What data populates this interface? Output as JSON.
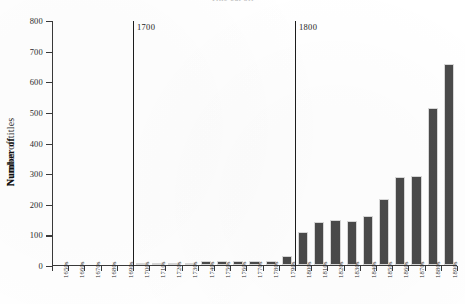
{
  "chart_data": {
    "type": "bar",
    "title": "Title cut off",
    "xlabel": "",
    "ylabel": "Number of titles",
    "ylabel_overlap": "Number of",
    "ylim": [
      0,
      800
    ],
    "yticks": [
      0,
      100,
      200,
      300,
      400,
      500,
      600,
      700,
      800
    ],
    "grid": false,
    "legend": false,
    "categories": [
      "1650s",
      "1660s",
      "1670s",
      "1680s",
      "1690s",
      "1700s",
      "1710s",
      "1720s",
      "1730s",
      "1740s",
      "1750s",
      "1760s",
      "1770s",
      "1780s",
      "1790s",
      "1800s",
      "1810s",
      "1820s",
      "1830s",
      "1840s",
      "1850s",
      "1860s",
      "1870s",
      "1880s",
      "1890s"
    ],
    "values": [
      0,
      0,
      0,
      0,
      0,
      2,
      3,
      6,
      6,
      11,
      12,
      13,
      13,
      14,
      30,
      108,
      141,
      146,
      145,
      160,
      215,
      288,
      290,
      516,
      660
    ],
    "annotations": [
      {
        "label": "1700",
        "at_category": "1700s"
      },
      {
        "label": "1800",
        "at_category": "1800s"
      }
    ]
  },
  "colors": {
    "bar": "#4a4a4a",
    "axis": "#3a3a3a",
    "marker": "#1c1c1c",
    "background": "#ffffff"
  }
}
